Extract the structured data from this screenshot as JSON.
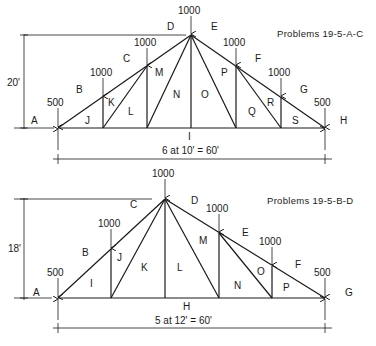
{
  "truss_a": {
    "title": "Problems 19-5-A-C",
    "height_label": "20'",
    "span_label": "6 at 10' = 60'",
    "loads": [
      "500",
      "1000",
      "1000",
      "1000",
      "1000",
      "1000",
      "500"
    ],
    "regions": {
      "A": "A",
      "B": "B",
      "C": "C",
      "D": "D",
      "E": "E",
      "F": "F",
      "G": "G",
      "H": "H",
      "I": "I",
      "J": "J",
      "K": "K",
      "L": "L",
      "M": "M",
      "N": "N",
      "O": "O",
      "P": "P",
      "Q": "Q",
      "R": "R",
      "S": "S"
    }
  },
  "truss_b": {
    "title": "Problems 19-5-B-D",
    "height_label": "18'",
    "span_label": "5 at 12' = 60'",
    "loads": [
      "500",
      "1000",
      "1000",
      "1000",
      "1000",
      "500"
    ],
    "regions": {
      "A": "A",
      "B": "B",
      "C": "C",
      "D": "D",
      "E": "E",
      "F": "F",
      "G": "G",
      "H": "H",
      "I": "I",
      "J": "J",
      "K": "K",
      "L": "L",
      "M": "M",
      "N": "N",
      "O": "O",
      "P": "P"
    }
  }
}
